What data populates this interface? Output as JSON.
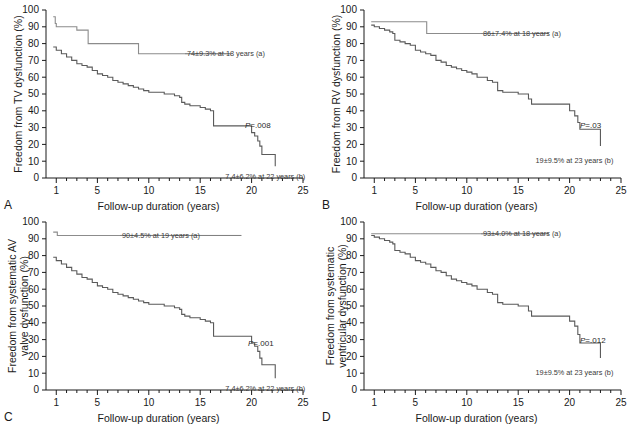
{
  "figure": {
    "xlabel": "Follow-up duration (years)",
    "xticks": [
      1,
      5,
      10,
      15,
      20,
      25
    ],
    "yticks": [
      0,
      10,
      20,
      30,
      40,
      50,
      60,
      70,
      80,
      90,
      100
    ],
    "xlim": [
      0,
      25
    ],
    "ylim": [
      0,
      100
    ],
    "colors": {
      "curve_a": "#8c8c8c",
      "curve_b": "#5a5a5a",
      "axis": "#1a1a1a",
      "text": "#1a1a1a",
      "annotation": "#3a3a3a"
    }
  },
  "panels": [
    {
      "letter": "A",
      "ylabel": "Freedom from TV dysfunction (%)",
      "ylabel_lines": [
        "Freedom from TV dysfunction (%)"
      ],
      "pvalue": "P=.008",
      "label_a": "74±9.3% at 18 years (a)",
      "label_b": "7.4±6.2% at 22 years (b)"
    },
    {
      "letter": "B",
      "ylabel": "Freedom from RV dysfunction (%)",
      "ylabel_lines": [
        "Freedom from RV dysfunction (%)"
      ],
      "pvalue": "P=.03",
      "label_a": "86±7.4% at 18 years (a)",
      "label_b": "19±9.5% at 23 years (b)"
    },
    {
      "letter": "C",
      "ylabel": "Freedom from systematic AV valve dysfunction (%)",
      "ylabel_lines": [
        "Freedom from systematic AV",
        "valve dysfunction (%)"
      ],
      "pvalue": "P=.001",
      "label_a": "90±4.5% at 19 years (a)",
      "label_b": "7.4±6.2% at 22 years (b)"
    },
    {
      "letter": "D",
      "ylabel": "Freedom from systematic ventricular dysfunction (%)",
      "ylabel_lines": [
        "Freedom from systematic",
        "ventricular dysfunction (%)"
      ],
      "pvalue": "P=.012",
      "label_a": "93±4.0% at 18 years (a)",
      "label_b": "19±9.5% at 23 years (b)"
    }
  ],
  "chart_data": {
    "type": "line",
    "title": "",
    "xlabel": "Follow-up duration (years)",
    "ylabel": "Freedom from dysfunction (%)",
    "xlim": [
      0,
      25
    ],
    "ylim": [
      0,
      100
    ],
    "grid": false,
    "legend_position": "none",
    "note": "Four Kaplan-Meier freedom-from-event curves; each panel has curve (a) upper and curve (b) lower step functions.",
    "panels": [
      {
        "panel": "A",
        "ylabel": "Freedom from TV dysfunction (%)",
        "pvalue": 0.008,
        "series": [
          {
            "name": "a",
            "endpoint_label": "74±9.3% at 18 years (a)",
            "x": [
              0.7,
              0.8,
              0.9,
              1.0,
              2.8,
              3.0,
              4.0,
              4.1,
              8.8,
              9.0,
              18.0
            ],
            "y": [
              96,
              96,
              92,
              90,
              90,
              88,
              88,
              80,
              80,
              74,
              74
            ]
          },
          {
            "name": "b",
            "endpoint_label": "7.4±6.2% at 22 years (b)",
            "x": [
              0.7,
              1.0,
              1.5,
              2.0,
              2.5,
              3.0,
              3.5,
              4.0,
              4.5,
              5.0,
              5.5,
              6.0,
              6.5,
              7.0,
              7.5,
              8.0,
              8.5,
              9.0,
              9.5,
              10.0,
              11.0,
              11.5,
              12.0,
              12.5,
              13.0,
              13.2,
              13.5,
              14.0,
              15.0,
              15.5,
              16.0,
              16.3,
              17.0,
              19.5,
              20.0,
              20.3,
              20.6,
              20.8,
              21.0,
              22.3
            ],
            "y": [
              78,
              76,
              74,
              72,
              70,
              68,
              67,
              66,
              64,
              62,
              61,
              60,
              58,
              57,
              56,
              55,
              54,
              53,
              52,
              51,
              51,
              50,
              50,
              49,
              48,
              45,
              44,
              43,
              42,
              41,
              40,
              31,
              31,
              31,
              27,
              25,
              22,
              19,
              14,
              7
            ]
          }
        ]
      },
      {
        "panel": "B",
        "ylabel": "Freedom from RV dysfunction (%)",
        "pvalue": 0.03,
        "series": [
          {
            "name": "a",
            "endpoint_label": "86±7.4% at 18 years (a)",
            "x": [
              0.7,
              6.0,
              6.1,
              18.0
            ],
            "y": [
              93,
              93,
              86,
              86
            ]
          },
          {
            "name": "b",
            "endpoint_label": "19±9.5% at 23 years (b)",
            "x": [
              0.7,
              1.0,
              1.5,
              2.0,
              2.5,
              2.8,
              3.0,
              3.5,
              4.0,
              4.5,
              5.0,
              5.5,
              6.0,
              6.5,
              7.0,
              7.5,
              8.0,
              8.5,
              9.0,
              9.5,
              10.0,
              10.5,
              11.0,
              11.5,
              12.0,
              12.5,
              13.0,
              13.5,
              14.0,
              15.0,
              15.5,
              16.0,
              16.3,
              17.0,
              19.8,
              20.0,
              20.5,
              20.8,
              21.0,
              22.3,
              23.0
            ],
            "y": [
              91,
              90,
              89,
              88,
              87,
              86,
              82,
              81,
              80,
              79,
              76,
              75,
              74,
              73,
              70,
              69,
              67,
              66,
              65,
              64,
              63,
              62,
              60,
              60,
              58,
              57,
              52,
              51,
              51,
              50,
              50,
              47,
              44,
              44,
              44,
              40,
              37,
              33,
              29,
              29,
              19
            ]
          }
        ]
      },
      {
        "panel": "C",
        "ylabel": "Freedom from systematic AV valve dysfunction (%)",
        "pvalue": 0.001,
        "series": [
          {
            "name": "a",
            "endpoint_label": "90±4.5% at 19 years (a)",
            "x": [
              0.7,
              1.0,
              1.1,
              19.0
            ],
            "y": [
              94,
              94,
              92,
              92
            ]
          },
          {
            "name": "b",
            "endpoint_label": "7.4±6.2% at 22 years (b)",
            "x": [
              0.7,
              1.0,
              1.5,
              2.0,
              2.5,
              3.0,
              3.5,
              4.0,
              4.5,
              5.0,
              5.5,
              6.0,
              6.5,
              7.0,
              7.5,
              8.0,
              8.5,
              9.0,
              9.5,
              10.0,
              11.0,
              11.5,
              12.0,
              12.5,
              13.0,
              13.2,
              13.5,
              14.0,
              15.0,
              15.5,
              16.0,
              16.3,
              17.0,
              19.5,
              20.0,
              20.3,
              20.6,
              20.8,
              21.0,
              22.3
            ],
            "y": [
              79,
              77,
              75,
              73,
              71,
              69,
              67,
              66,
              64,
              62,
              61,
              60,
              58,
              57,
              56,
              55,
              54,
              53,
              52,
              51,
              51,
              50,
              50,
              49,
              48,
              45,
              44,
              43,
              42,
              41,
              40,
              32,
              32,
              32,
              28,
              26,
              23,
              19,
              15,
              7
            ]
          }
        ]
      },
      {
        "panel": "D",
        "ylabel": "Freedom from systematic ventricular dysfunction (%)",
        "pvalue": 0.012,
        "series": [
          {
            "name": "a",
            "endpoint_label": "93±4.0% at 18 years (a)",
            "x": [
              0.7,
              18.0
            ],
            "y": [
              93,
              93
            ]
          },
          {
            "name": "b",
            "endpoint_label": "19±9.5% at 23 years (b)",
            "x": [
              0.7,
              1.0,
              1.5,
              2.0,
              2.5,
              2.8,
              3.0,
              3.5,
              4.0,
              4.5,
              5.0,
              5.5,
              6.0,
              6.5,
              7.0,
              7.5,
              8.0,
              8.5,
              9.0,
              9.5,
              10.0,
              10.5,
              11.0,
              11.5,
              12.0,
              12.5,
              13.0,
              13.5,
              14.0,
              15.0,
              15.5,
              16.0,
              16.3,
              17.0,
              19.8,
              20.0,
              20.5,
              20.8,
              21.0,
              22.3,
              23.0
            ],
            "y": [
              92,
              91,
              90,
              89,
              88,
              87,
              83,
              82,
              81,
              79,
              77,
              76,
              75,
              73,
              71,
              70,
              68,
              66,
              65,
              64,
              63,
              62,
              60,
              60,
              58,
              57,
              52,
              51,
              51,
              50,
              50,
              47,
              44,
              44,
              44,
              41,
              38,
              33,
              28,
              28,
              19
            ]
          }
        ]
      }
    ]
  }
}
